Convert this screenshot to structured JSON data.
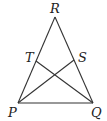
{
  "diagram": {
    "type": "geometry-triangle",
    "points": {
      "R": {
        "label": "R"
      },
      "T": {
        "label": "T"
      },
      "S": {
        "label": "S"
      },
      "P": {
        "label": "P"
      },
      "Q": {
        "label": "Q"
      }
    },
    "segments": [
      {
        "from": "P",
        "to": "R",
        "name": "side-pr"
      },
      {
        "from": "R",
        "to": "Q",
        "name": "side-rq"
      },
      {
        "from": "P",
        "to": "Q",
        "name": "side-pq"
      },
      {
        "from": "P",
        "to": "S",
        "name": "segment-ps"
      },
      {
        "from": "Q",
        "to": "T",
        "name": "segment-qt"
      }
    ],
    "line_color": "#333333"
  }
}
